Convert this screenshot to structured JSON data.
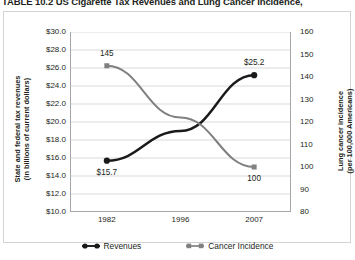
{
  "title": "TABLE 10.2  US Cigarette Tax Revenues and Lung Cancer Incidence,",
  "legend": {
    "revenues_label": "Revenues",
    "incidence_label": "Cancer Incidence",
    "revenues_icon": "filled-circle-line-marker",
    "incidence_icon": "filled-square-line-marker"
  },
  "colors": {
    "revenues": "#1a1a1a",
    "incidence": "#808080",
    "gridline": "#d9d9d9",
    "axis": "#a6a6a6",
    "text": "#231f20",
    "background": "#ffffff"
  },
  "chart_data": {
    "type": "line",
    "title": "TABLE 10.2  US Cigarette Tax Revenues and Lung Cancer Incidence,",
    "xlabel": "",
    "x": [
      "1982",
      "1996",
      "2007"
    ],
    "categories": [
      "1982",
      "1996",
      "2007"
    ],
    "grid": true,
    "legend_position": "bottom",
    "axes": [
      {
        "id": "left",
        "ylabel": "State and federal tax revenues (in billions of current dollars)",
        "ylabel_lines": [
          "State and federal tax revenues",
          "(in billions of current dollars)"
        ],
        "ylim": [
          10.0,
          30.0
        ],
        "ytick_step": 2.0,
        "yticks": [
          "$30.0",
          "$28.0",
          "$26.0",
          "$24.0",
          "$22.0",
          "$20.0",
          "$18.0",
          "$16.0",
          "$14.0",
          "$12.0",
          "$10.0"
        ],
        "ytick_values": [
          30.0,
          28.0,
          26.0,
          24.0,
          22.0,
          20.0,
          18.0,
          16.0,
          14.0,
          12.0,
          10.0
        ]
      },
      {
        "id": "right",
        "ylabel": "Lung cancer incidence (per 100,000 Americans)",
        "ylabel_lines": [
          "Lung cancer incidence",
          "(per 100,000 Americans)"
        ],
        "ylim": [
          80,
          160
        ],
        "ytick_step": 10,
        "yticks": [
          "160",
          "150",
          "140",
          "130",
          "120",
          "110",
          "100",
          "90",
          "80"
        ],
        "ytick_values": [
          160,
          150,
          140,
          130,
          120,
          110,
          100,
          90,
          80
        ]
      }
    ],
    "series": [
      {
        "name": "Revenues",
        "axis": "left",
        "color": "#1a1a1a",
        "marker": "circle",
        "values": [
          15.7,
          19.0,
          25.2
        ],
        "point_labels": [
          "$15.7",
          "",
          "$25.2"
        ],
        "label_positions": [
          "below",
          "",
          "above"
        ]
      },
      {
        "name": "Cancer Incidence",
        "axis": "right",
        "color": "#808080",
        "marker": "square",
        "values": [
          145,
          122,
          100
        ],
        "point_labels": [
          "145",
          "",
          "100"
        ],
        "label_positions": [
          "above",
          "",
          "below"
        ]
      }
    ],
    "annotations": [
      {
        "text": "145",
        "series": "Cancer Incidence",
        "x": "1982"
      },
      {
        "text": "$15.7",
        "series": "Revenues",
        "x": "1982"
      },
      {
        "text": "$25.2",
        "series": "Revenues",
        "x": "2007"
      },
      {
        "text": "100",
        "series": "Cancer Incidence",
        "x": "2007"
      }
    ]
  }
}
